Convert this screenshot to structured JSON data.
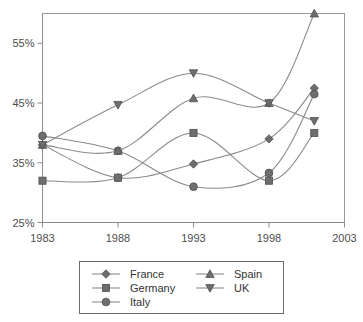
{
  "chart_data": {
    "type": "line",
    "title": "",
    "subtitle": "",
    "xlabel": "",
    "ylabel": "",
    "x": [
      1983,
      1988,
      1993,
      1998,
      2001
    ],
    "xlim": [
      1983,
      2003
    ],
    "ylim": [
      25,
      60
    ],
    "x_ticks": [
      "1983",
      "1988",
      "1993",
      "1998",
      "2003"
    ],
    "x_tick_values": [
      1983,
      1988,
      1993,
      1998,
      2003
    ],
    "y_ticks": [
      "25%",
      "35%",
      "45%",
      "55%"
    ],
    "y_tick_values": [
      25,
      35,
      45,
      55
    ],
    "grid": false,
    "legend_position": "bottom",
    "series": [
      {
        "name": "France",
        "marker": "diamond",
        "values": [
          38.0,
          32.5,
          34.8,
          39.0,
          47.5
        ]
      },
      {
        "name": "Germany",
        "marker": "square",
        "values": [
          32.0,
          32.5,
          40.0,
          32.0,
          40.0
        ]
      },
      {
        "name": "Italy",
        "marker": "circle",
        "values": [
          39.5,
          37.0,
          31.0,
          33.3,
          46.5
        ]
      },
      {
        "name": "Spain",
        "marker": "triangle-up",
        "values": [
          38.0,
          37.0,
          45.8,
          45.0,
          60.0
        ]
      },
      {
        "name": "UK",
        "marker": "triangle-down",
        "values": [
          38.0,
          44.7,
          50.0,
          45.0,
          42.0
        ]
      }
    ]
  },
  "legend": {
    "entries": [
      {
        "label": "France",
        "marker": "diamond"
      },
      {
        "label": "Germany",
        "marker": "square"
      },
      {
        "label": "Italy",
        "marker": "circle"
      },
      {
        "label": "Spain",
        "marker": "triangle-up"
      },
      {
        "label": "UK",
        "marker": "triangle-down"
      }
    ]
  },
  "colors": {
    "line": "#8a8a8a",
    "marker_fill": "#6e6e6e",
    "marker_stroke": "#4f4f4f",
    "axis": "#8c8c8c",
    "text": "#4d4d4d",
    "plot_border": "#9a9a9a",
    "legend_border": "#6b6b6b",
    "background": "#ffffff"
  }
}
